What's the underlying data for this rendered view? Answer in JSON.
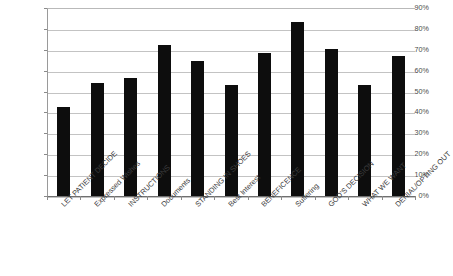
{
  "chart_data": {
    "type": "bar",
    "title": "",
    "subtitle": "",
    "xlabel": "",
    "ylabel": "",
    "ylim": [
      0,
      0.9
    ],
    "grid": true,
    "legend": false,
    "value_format": "percent",
    "bar_color": "#0d0d0d",
    "categories": [
      "LET PATIENT DECIDE",
      "Expressed Wishes",
      "INSTRUCTIONS",
      "Documents",
      "STANDING IN SHOES",
      "Best Interest",
      "BENEFICENCE",
      "Suffering",
      "GOD'S DECISION",
      "WHAT WE WANT",
      "DENIAL/OPTING OUT"
    ],
    "values": [
      42.5,
      54.0,
      56.5,
      72.5,
      64.5,
      53.0,
      68.5,
      83.5,
      70.5,
      53.0,
      67.0
    ],
    "ytick_labels": [
      "90%",
      "80%",
      "70%",
      "60%",
      "50%",
      "40%",
      "30%",
      "20%",
      "10%",
      "0%"
    ],
    "ytick_values": [
      90,
      80,
      70,
      60,
      50,
      40,
      30,
      20,
      10,
      0
    ]
  }
}
